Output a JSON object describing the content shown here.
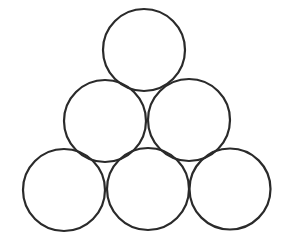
{
  "diagram": {
    "type": "circle-pyramid",
    "background": "#ffffff",
    "stroke_color": "#2a2a2a",
    "stroke_width": 2.2,
    "rows": [
      {
        "name": "top-row",
        "circles": [
          {
            "cx": 144,
            "cy": 50,
            "r": 41
          }
        ]
      },
      {
        "name": "middle-row",
        "circles": [
          {
            "cx": 105,
            "cy": 121,
            "r": 41
          },
          {
            "cx": 189,
            "cy": 120,
            "r": 41
          }
        ]
      },
      {
        "name": "bottom-row",
        "circles": [
          {
            "cx": 64,
            "cy": 190,
            "r": 41
          },
          {
            "cx": 148,
            "cy": 189,
            "r": 41
          },
          {
            "cx": 230,
            "cy": 189,
            "r": 40.5
          }
        ]
      }
    ],
    "circle_count": 6
  }
}
